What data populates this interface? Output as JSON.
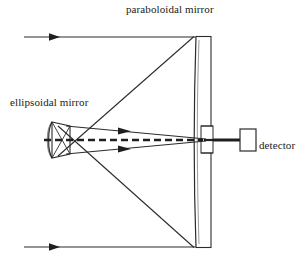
{
  "figure": {
    "name": "optical-layout-diagram",
    "background_color": "#ffffff",
    "line_color": "#2b2b2b",
    "width": 303,
    "height": 264
  },
  "labels": {
    "paraboloidal_mirror": "paraboloidal mirror",
    "ellipsoidal_mirror": "ellipsoidal mirror",
    "detector": "detector"
  },
  "components": {
    "paraboloidal_mirror": {
      "type": "curved-mirror",
      "orientation": "vertical-concave-left",
      "aperture": "central hole for beam pass-through"
    },
    "ellipsoidal_mirror": {
      "type": "small-concave-mirror",
      "orientation": "concave-left"
    },
    "detector": {
      "type": "rectangular-box"
    }
  },
  "beams": {
    "incoming_rays": 2,
    "incoming_direction": "left-to-right",
    "converging_rays": 2,
    "optical_axis": "dashed horizontal center line"
  }
}
